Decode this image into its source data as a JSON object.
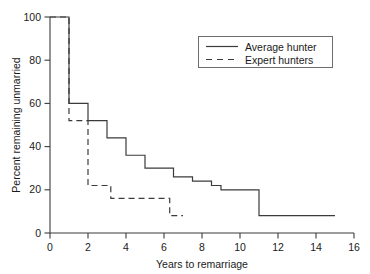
{
  "chart_data": {
    "type": "line",
    "title": "",
    "subtitle": "",
    "xlabel": "Years to remarriage",
    "ylabel": "Percent remaining unmarried",
    "xlim": [
      0,
      16
    ],
    "ylim": [
      0,
      100
    ],
    "xticks": [
      0,
      2,
      4,
      6,
      8,
      10,
      12,
      14,
      16
    ],
    "yticks": [
      0,
      20,
      40,
      60,
      80,
      100
    ],
    "xtick_labels": [
      "0",
      "2",
      "4",
      "6",
      "8",
      "10",
      "12",
      "14",
      "16"
    ],
    "ytick_labels": [
      "0",
      "20",
      "40",
      "60",
      "80",
      "100"
    ],
    "grid": false,
    "step_style": "post",
    "legend_position": "top-right",
    "series": [
      {
        "name": "Average hunter",
        "style": "solid",
        "x": [
          0,
          1,
          2,
          3,
          4,
          5,
          6.5,
          7.5,
          8.5,
          9,
          11,
          15
        ],
        "values": [
          100,
          60,
          52,
          44,
          36,
          30,
          26,
          24,
          22,
          20,
          8,
          8
        ]
      },
      {
        "name": "Expert hunters",
        "style": "dashed",
        "x": [
          0,
          1,
          2,
          3.2,
          6.3,
          7
        ],
        "values": [
          100,
          52,
          22,
          16,
          8,
          8
        ]
      }
    ],
    "annotations": []
  },
  "legend": {
    "entries": [
      {
        "label": "Average hunter"
      },
      {
        "label": "Expert hunters"
      }
    ]
  },
  "colors": {
    "line": "#3b3b3b",
    "text": "#1a1a1a",
    "background": "#ffffff",
    "legend_border": "#6d6d6d"
  }
}
